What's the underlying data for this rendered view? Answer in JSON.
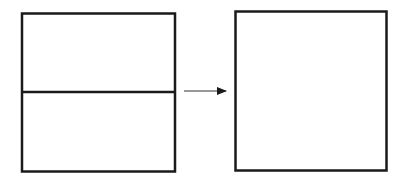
{
  "diagram": {
    "stroke_color": "#1a1a1a",
    "background": "#ffffff",
    "left_shape": {
      "type": "rectangle",
      "divisions": 2,
      "orientation": "horizontal-split"
    },
    "arrow": {
      "direction": "right"
    },
    "right_shape": {
      "type": "square",
      "divisions": 1
    }
  }
}
